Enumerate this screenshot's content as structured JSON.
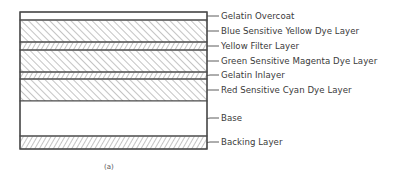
{
  "diagram": {
    "caption": "(a)",
    "stack_box": {
      "left": 20,
      "right": 207,
      "top": 12,
      "bottom": 149
    },
    "layers": [
      {
        "id": "gelatin-overcoat",
        "label": "Gelatin Overcoat",
        "top": 12,
        "bottom": 20,
        "pattern": "none",
        "label_y": 16
      },
      {
        "id": "blue-sensitive-yellow-dye",
        "label": "Blue Sensitive Yellow Dye Layer",
        "top": 20,
        "bottom": 42,
        "pattern": "backslash",
        "label_y": 31
      },
      {
        "id": "yellow-filter",
        "label": "Yellow Filter Layer",
        "top": 42,
        "bottom": 50,
        "pattern": "slash",
        "label_y": 46
      },
      {
        "id": "green-sensitive-magenta-dye",
        "label": "Green Sensitive Magenta Dye Layer",
        "top": 50,
        "bottom": 72,
        "pattern": "backslash",
        "label_y": 61
      },
      {
        "id": "gelatin-inlayer",
        "label": "Gelatin Inlayer",
        "top": 72,
        "bottom": 79,
        "pattern": "slash",
        "label_y": 75
      },
      {
        "id": "red-sensitive-cyan-dye",
        "label": "Red Sensitive Cyan Dye Layer",
        "top": 79,
        "bottom": 101,
        "pattern": "backslash",
        "label_y": 90
      },
      {
        "id": "base",
        "label": "Base",
        "top": 101,
        "bottom": 136,
        "pattern": "none",
        "label_y": 118
      },
      {
        "id": "backing-layer",
        "label": "Backing Layer",
        "top": 136,
        "bottom": 149,
        "pattern": "slash",
        "label_y": 142
      }
    ],
    "colors": {
      "line": "#4a4a4a",
      "hatch": "#8a8a8a",
      "background": "#ffffff"
    }
  }
}
